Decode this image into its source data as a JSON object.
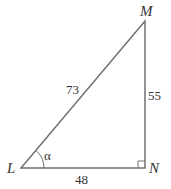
{
  "diagram": {
    "type": "right-triangle",
    "vertices": {
      "L": {
        "label": "L",
        "x": 21,
        "y": 168
      },
      "M": {
        "label": "M",
        "x": 145,
        "y": 21
      },
      "N": {
        "label": "N",
        "x": 145,
        "y": 168
      }
    },
    "sides": {
      "LM": {
        "label": "73"
      },
      "MN": {
        "label": "55"
      },
      "LN": {
        "label": "48"
      }
    },
    "angle_label": "α",
    "right_angle_at": "N",
    "line_color": "#707070",
    "text_color": "#333333"
  }
}
